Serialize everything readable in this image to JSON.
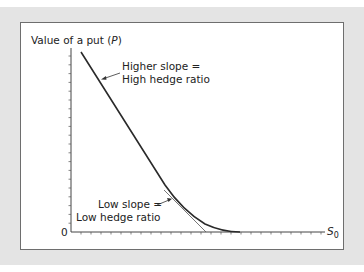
{
  "chart_data": {
    "type": "line",
    "title": "Value of a put (P)",
    "title_text": "Value of a put (",
    "title_var": "P",
    "title_close": ")",
    "xlabel": "S0",
    "xlabel_main": "S",
    "xlabel_sub": "0",
    "ylabel": "Value of a put (P)",
    "origin_label": "0",
    "grid": false,
    "legend": null,
    "series": [
      {
        "name": "Put value curve",
        "points": [
          [
            81,
            52
          ],
          [
            165,
            185
          ],
          [
            175,
            199
          ],
          [
            190,
            214
          ],
          [
            205,
            224
          ],
          [
            220,
            229
          ],
          [
            235,
            231
          ],
          [
            240,
            232
          ]
        ]
      },
      {
        "name": "Tangent (low slope)",
        "points": [
          [
            165,
            191
          ],
          [
            205,
            232
          ]
        ]
      }
    ],
    "annotations": [
      {
        "id": "high",
        "line1": "Higher slope =",
        "line2": "High hedge ratio"
      },
      {
        "id": "low",
        "line1": "Low slope =",
        "line2": "Low hedge ratio"
      }
    ],
    "x_ticks_count": 25,
    "y_ticks_count": 21
  },
  "colors": {
    "background": "#e4e4e4",
    "panel": "#ffffff",
    "line": "#2a2a2a",
    "tangent": "#555555",
    "axis": "#444444"
  }
}
